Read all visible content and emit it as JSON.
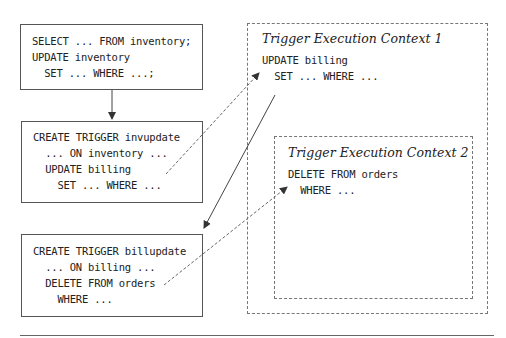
{
  "statements": {
    "main": [
      "SELECT ... FROM inventory;",
      "UPDATE inventory",
      "  SET ... WHERE ...;"
    ],
    "trigger1": [
      "CREATE TRIGGER invupdate",
      "  ... ON inventory ...",
      "  UPDATE billing",
      "    SET ... WHERE ..."
    ],
    "trigger2": [
      "CREATE TRIGGER billupdate",
      "  ... ON billing ...",
      "  DELETE FROM orders",
      "    WHERE ..."
    ]
  },
  "contexts": {
    "ctx1": {
      "title": "Trigger Execution Context 1",
      "lines": [
        "UPDATE billing",
        "  SET ... WHERE ..."
      ]
    },
    "ctx2": {
      "title": "Trigger Execution Context 2",
      "lines": [
        "DELETE FROM orders",
        "  WHERE ..."
      ]
    }
  },
  "colors": {
    "line": "#444444",
    "dashed": "#666666"
  }
}
